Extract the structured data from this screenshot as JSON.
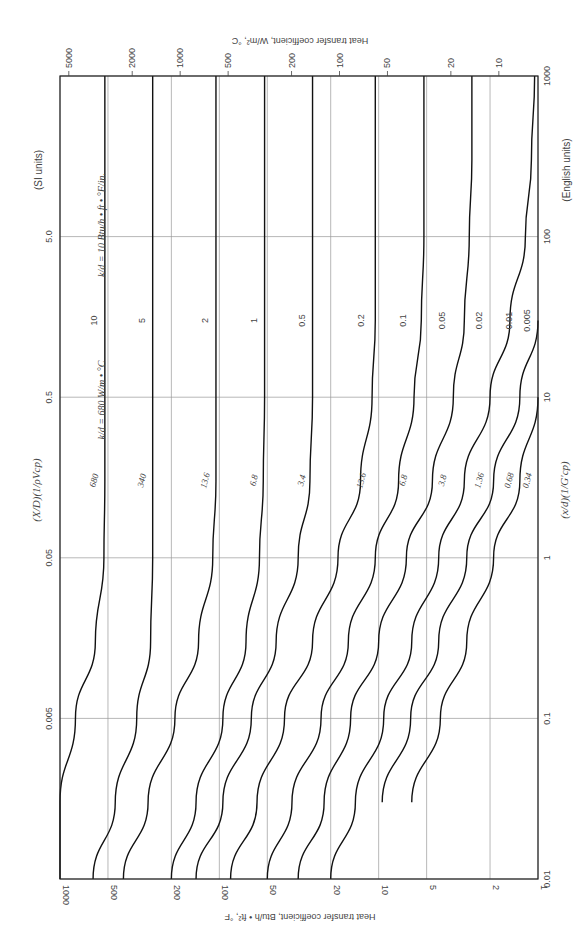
{
  "chart_data": {
    "type": "line",
    "title": "",
    "orientation_note": "Figure printed rotated 90° counter-clockwise on the page",
    "xscale": "log",
    "yscale": "log",
    "x_english": {
      "label": "(x/d)(1/(G'cp))",
      "units_label": "(English units)",
      "ticks": [
        "0.01",
        "0.1",
        "1",
        "10",
        "100",
        "1000"
      ],
      "range": [
        0.01,
        1000
      ]
    },
    "x_si": {
      "label": "(X/D)(1/(ρVcp))",
      "units_label": "(SI units)",
      "ticks": [
        "0.005",
        "0.05",
        "0.5",
        "5.0"
      ]
    },
    "y_english": {
      "label": "Heat transfer coefficient, Btu/h • ft², °F",
      "ticks": [
        "1000",
        "500",
        "200",
        "100",
        "50",
        "20",
        "10",
        "5",
        "2",
        "1"
      ],
      "range": [
        1,
        1000
      ]
    },
    "y_si": {
      "label": "Heat transfer coefficient, W/m², °C",
      "ticks": [
        "5000",
        "2000",
        "1000",
        "500",
        "200",
        "100",
        "50",
        "20",
        "10"
      ]
    },
    "parameter_labels": {
      "english": "k/d = 10 Btu/h • ft • °F/in.",
      "si": "k/d = 680 W/m • °C"
    },
    "x": [
      0.01,
      0.03,
      0.1,
      0.3,
      1,
      3,
      10,
      30,
      100,
      300,
      1000
    ],
    "series": [
      {
        "name": "k/d = 10 (680)",
        "english": "10",
        "si": "680",
        "values": [
          1000,
          1000,
          800,
          600,
          530,
          523,
          523,
          523,
          523,
          523,
          523
        ]
      },
      {
        "name": "k/d = 5 (340)",
        "english": "5",
        "si": "340",
        "values": [
          620,
          450,
          330,
          270,
          262,
          262,
          262,
          262,
          262,
          262,
          262
        ]
      },
      {
        "name": "k/d = 2 (136)",
        "english": "2",
        "si": "13.6",
        "values": [
          400,
          280,
          190,
          135,
          110,
          105,
          105,
          105,
          105,
          105,
          105
        ]
      },
      {
        "name": "k/d = 1 (68)",
        "english": "1",
        "si": "6.8",
        "values": [
          200,
          140,
          95,
          68,
          56,
          53,
          52,
          52,
          52,
          52,
          52
        ]
      },
      {
        "name": "k/d = 0.5 (34)",
        "english": "0.5",
        "si": "3.4",
        "values": [
          140,
          95,
          63,
          44,
          32,
          27,
          26,
          26,
          26,
          26,
          26
        ]
      },
      {
        "name": "k/d = 0.2 (13.6)",
        "english": "0.2",
        "si": "13.6",
        "values": [
          85,
          58,
          39,
          26,
          18,
          13,
          11,
          10.5,
          10.5,
          10.5,
          10.5
        ]
      },
      {
        "name": "k/d = 0.1 (6.8)",
        "english": "0.1",
        "si": "6.8",
        "values": [
          50,
          35,
          23,
          15.5,
          10.5,
          7.5,
          6,
          5.4,
          5.2,
          5.2,
          5.2
        ]
      },
      {
        "name": "k/d = 0.05 (3.8)",
        "english": "0.05",
        "si": "3.8",
        "values": [
          32,
          22,
          15,
          10,
          6.7,
          4.6,
          3.4,
          2.9,
          2.7,
          2.6,
          2.6
        ]
      },
      {
        "name": "k/d = 0.02 (1.36)",
        "english": "0.02",
        "si": "1.36",
        "values": [
          20,
          14,
          9.3,
          6.2,
          4.2,
          2.9,
          2,
          1.5,
          1.2,
          1.1,
          1.05
        ]
      },
      {
        "name": "k/d = 0.01 (0.68)",
        "english": "0.01",
        "si": "0.68",
        "values": [
          null,
          9.5,
          6.3,
          4.2,
          2.8,
          1.9,
          1.3,
          1,
          null,
          null,
          null
        ]
      },
      {
        "name": "k/d = 0.005 (0.34)",
        "english": "0.005",
        "si": "0.34",
        "values": [
          null,
          6.2,
          4.1,
          2.8,
          1.9,
          1.3,
          1,
          null,
          null,
          null,
          null
        ]
      }
    ],
    "grid": true,
    "legend": "inline curve labels"
  },
  "labels": {
    "si_units": "(SI units)",
    "english_units": "(English units)",
    "y_si_title": "Heat transfer coefficient, W/m², °C",
    "y_en_title": "Heat transfer coefficient, Btu/h • ft², °F",
    "kd_english": "k/d = 10 Btu/h • ft • °F/in.",
    "kd_si": "k/d = 680 W/m • °C"
  }
}
